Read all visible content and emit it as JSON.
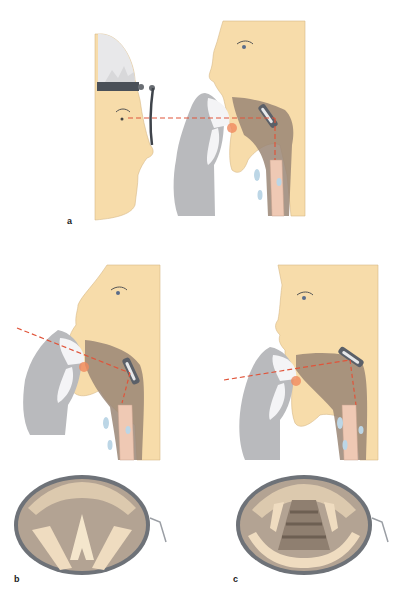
{
  "figure": {
    "panels": [
      {
        "id": "a",
        "label": "a",
        "description": "Examiner with head mirror reflecting light into patient's mouth; laryngeal mirror in oropharynx; line of sight horizontal"
      },
      {
        "id": "b",
        "label": "b",
        "description": "Patient profile with head tilted; line of sight descending; mirror view shows open glottis (vocal cords abducted)"
      },
      {
        "id": "c",
        "label": "c",
        "description": "Patient profile with head extended; line of sight ascending; mirror view shows trachea rings"
      }
    ],
    "colors": {
      "skin": "#f7dcaa",
      "skin_line": "#c9a878",
      "glove": "#b9babd",
      "gauze": "#f4f4f6",
      "sight_line": "#e0543a",
      "mirror_metal": "#5b6068",
      "throat_shadow": "#9a8676",
      "trachea": "#efc9b4",
      "cartilage_blue": "#bcd6e6",
      "mirror_field": "#b3a393",
      "mirror_cord": "#efdcc0"
    }
  }
}
